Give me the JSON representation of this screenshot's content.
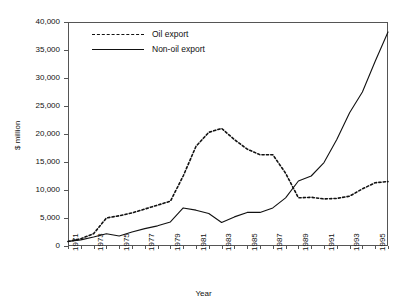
{
  "chart_data": {
    "type": "line",
    "title": "",
    "xlabel": "Year",
    "ylabel": "$ million",
    "xlim": [
      1971,
      1996
    ],
    "ylim": [
      0,
      40000
    ],
    "grid": false,
    "legend_position": "top-left inside",
    "y_ticks": [
      "0",
      "5,000",
      "10,000",
      "15,000",
      "20,000",
      "25,000",
      "30,000",
      "35,000",
      "40,000"
    ],
    "y_tick_values": [
      0,
      5000,
      10000,
      15000,
      20000,
      25000,
      30000,
      35000,
      40000
    ],
    "x_tick_labels": [
      "1971",
      "1973",
      "1975",
      "1977",
      "1979",
      "1981",
      "1983",
      "1985",
      "1987",
      "1989",
      "1991",
      "1993",
      "1995"
    ],
    "x_tick_values": [
      1971,
      1973,
      1975,
      1977,
      1979,
      1981,
      1983,
      1985,
      1987,
      1989,
      1991,
      1993,
      1995
    ],
    "x": [
      1971,
      1972,
      1973,
      1974,
      1975,
      1976,
      1977,
      1978,
      1979,
      1980,
      1981,
      1982,
      1983,
      1984,
      1985,
      1986,
      1987,
      1988,
      1989,
      1990,
      1991,
      1992,
      1993,
      1994,
      1995,
      1996
    ],
    "series": [
      {
        "name": "Oil export",
        "style": "dashed",
        "color": "#111111",
        "values": [
          800,
          1300,
          2200,
          5000,
          5400,
          5900,
          6600,
          7300,
          8000,
          12500,
          17800,
          20300,
          21000,
          19000,
          17300,
          16300,
          16300,
          13000,
          8600,
          8700,
          8400,
          8500,
          8900,
          10200,
          11300,
          11500
        ]
      },
      {
        "name": "Non-oil export",
        "style": "solid",
        "color": "#111111",
        "values": [
          800,
          1100,
          1600,
          2200,
          1800,
          2500,
          3100,
          3600,
          4300,
          6800,
          6400,
          5800,
          4200,
          5200,
          6000,
          6000,
          6800,
          8600,
          11600,
          12500,
          14900,
          19000,
          23800,
          27500,
          33000,
          38200
        ]
      }
    ],
    "annotations": []
  },
  "legend": {
    "items": [
      {
        "label": "Oil export",
        "style": "dashed"
      },
      {
        "label": "Non-oil export",
        "style": "solid"
      }
    ]
  }
}
